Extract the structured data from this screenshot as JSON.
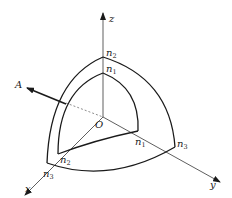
{
  "diagram": {
    "type": "3d-coordinate-octant-surfaces",
    "colors": {
      "stroke": "#1a1a1a",
      "background": "#ffffff"
    },
    "axes": {
      "origin_label": "O",
      "x_label": "x",
      "y_label": "y",
      "z_label": "z"
    },
    "vector": {
      "label": "A"
    },
    "inner_surface": {
      "z_label": {
        "base": "n",
        "sub": "1"
      },
      "y_label": {
        "base": "n",
        "sub": "1"
      },
      "x_label": {
        "base": "n",
        "sub": "2"
      }
    },
    "outer_surface": {
      "z_label": {
        "base": "n",
        "sub": "2"
      },
      "y_label": {
        "base": "n",
        "sub": "3"
      },
      "x_label": {
        "base": "n",
        "sub": "3"
      }
    }
  }
}
